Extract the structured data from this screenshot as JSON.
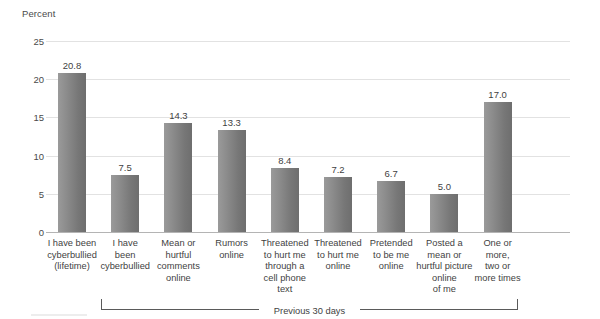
{
  "chart_data": {
    "type": "bar",
    "title": "",
    "xlabel": "",
    "ylabel": "Percent",
    "ylim": [
      0,
      25
    ],
    "yticks": [
      "0",
      "5",
      "10",
      "15",
      "20",
      "25"
    ],
    "grid": true,
    "legend": null,
    "bar_color": "#8a8a8a",
    "categories": [
      "I have been cyberbullied (lifetime)",
      "I have been cyberbullied",
      "Mean or hurtful comments online",
      "Rumors online",
      "Threatened to hurt me through a cell phone text",
      "Threatened to hurt me online",
      "Pretended to be me online",
      "Posted a mean or hurtful picture online of me",
      "One or more, two or more times"
    ],
    "category_lines": [
      [
        "I have been",
        "cyberbullied",
        "(lifetime)"
      ],
      [
        "I have",
        "been",
        "cyberbullied"
      ],
      [
        "Mean or",
        "hurtful",
        "comments",
        "online"
      ],
      [
        "Rumors",
        "online"
      ],
      [
        "Threatened",
        "to hurt me",
        "through a",
        "cell phone text"
      ],
      [
        "Threatened",
        "to hurt me",
        "online"
      ],
      [
        "Pretended",
        "to be me",
        "online"
      ],
      [
        "Posted a",
        "mean or",
        "hurtful picture",
        "online",
        "of me"
      ],
      [
        "One or",
        "more,",
        "two or",
        "more times"
      ]
    ],
    "values": [
      20.8,
      7.5,
      14.3,
      13.3,
      8.4,
      7.2,
      6.7,
      5.0,
      17.0
    ],
    "value_labels": [
      "20.8",
      "7.5",
      "14.3",
      "13.3",
      "8.4",
      "7.2",
      "6.7",
      "5.0",
      "17.0"
    ],
    "annotations": [
      {
        "text": "Previous 30 days",
        "type": "bracket",
        "spans_categories": [
          1,
          8
        ]
      }
    ]
  }
}
